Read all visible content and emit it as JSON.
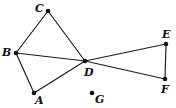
{
  "figure": {
    "background_color": "#ffffff",
    "line_color": "#1b1b1b",
    "point_color": "#111111",
    "width": 176,
    "height": 108
  },
  "points": [
    {
      "id": "A",
      "label": "A",
      "x": 34,
      "y": 93,
      "label_x": 35,
      "label_y": 95
    },
    {
      "id": "B",
      "label": "B",
      "x": 16,
      "y": 53,
      "label_x": 2,
      "label_y": 47
    },
    {
      "id": "C",
      "label": "C",
      "x": 48,
      "y": 11,
      "label_x": 35,
      "label_y": 3
    },
    {
      "id": "D",
      "label": "D",
      "x": 85,
      "y": 61,
      "label_x": 84,
      "label_y": 67
    },
    {
      "id": "E",
      "label": "E",
      "x": 166,
      "y": 44,
      "label_x": 162,
      "label_y": 29
    },
    {
      "id": "F",
      "label": "F",
      "x": 165,
      "y": 79,
      "label_x": 161,
      "label_y": 84
    },
    {
      "id": "G",
      "label": "G",
      "x": 92,
      "y": 93,
      "label_x": 95,
      "label_y": 94
    }
  ],
  "segments": [
    {
      "id": "BC",
      "from": "B",
      "to": "C"
    },
    {
      "id": "CD",
      "from": "C",
      "to": "D"
    },
    {
      "id": "BD",
      "from": "B",
      "to": "D"
    },
    {
      "id": "BA",
      "from": "B",
      "to": "A"
    },
    {
      "id": "AD",
      "from": "A",
      "to": "D"
    },
    {
      "id": "DE",
      "from": "D",
      "to": "E"
    },
    {
      "id": "DF",
      "from": "D",
      "to": "F"
    },
    {
      "id": "EF",
      "from": "E",
      "to": "F"
    }
  ],
  "isolated_points": [
    "G"
  ]
}
